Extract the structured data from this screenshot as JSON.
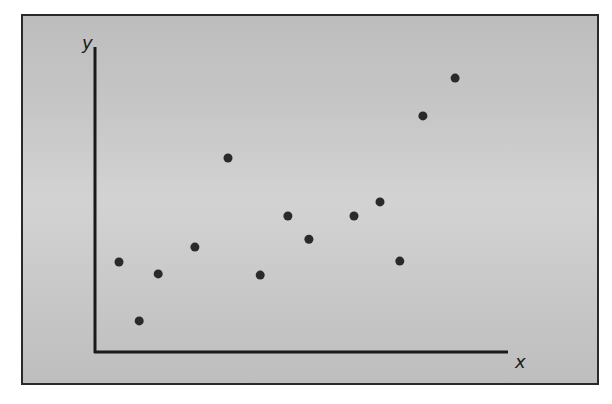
{
  "chart_data": {
    "type": "scatter",
    "title": "",
    "xlabel": "x",
    "ylabel": "y",
    "xlim": [
      0,
      100
    ],
    "ylim": [
      0,
      100
    ],
    "grid": false,
    "legend": null,
    "ticks": "none",
    "series": [
      {
        "name": "points",
        "points": [
          {
            "x": 5.8,
            "y": 29.5
          },
          {
            "x": 10.7,
            "y": 10.2
          },
          {
            "x": 15.3,
            "y": 25.6
          },
          {
            "x": 24.2,
            "y": 34.4
          },
          {
            "x": 32.2,
            "y": 63.6
          },
          {
            "x": 40.0,
            "y": 25.2
          },
          {
            "x": 46.7,
            "y": 44.6
          },
          {
            "x": 51.8,
            "y": 37.0
          },
          {
            "x": 62.7,
            "y": 44.6
          },
          {
            "x": 69.0,
            "y": 49.2
          },
          {
            "x": 73.8,
            "y": 29.8
          },
          {
            "x": 79.4,
            "y": 77.4
          },
          {
            "x": 87.2,
            "y": 89.8
          }
        ]
      }
    ],
    "colors": {
      "point": "#2a2a2a",
      "axis": "#1a1a1a",
      "background": "#c8c8c8",
      "frame": "#2a2a2a"
    }
  }
}
